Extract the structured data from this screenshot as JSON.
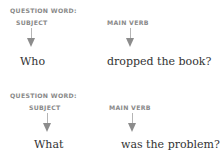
{
  "examples": [
    {
      "question_word_label": "QUESTION WORD:",
      "subject_label": "SUBJECT",
      "verb_label": "MAIN VERB",
      "subject_word": "Who",
      "verb_phrase": "dropped the book?"
    },
    {
      "question_word_label": "QUESTION WORD:",
      "subject_label": "SUBJECT",
      "verb_label": "MAIN VERB",
      "subject_word": "What",
      "verb_phrase": "was the problem?"
    }
  ],
  "colors": {
    "label": "#8a8a8a",
    "text": "#333333",
    "arrow": "#8c8c8c"
  }
}
